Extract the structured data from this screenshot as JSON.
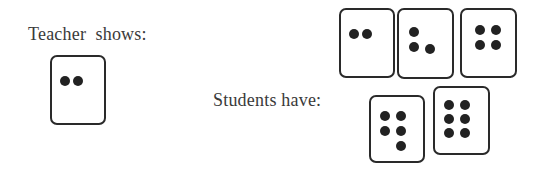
{
  "teacher": {
    "label": "Teacher  shows:",
    "card": {
      "count": 2,
      "dots": [
        [
          13,
          24
        ],
        [
          26,
          24
        ]
      ]
    }
  },
  "students": {
    "label": "Students have:",
    "cards": [
      {
        "count": 2,
        "dots": [
          [
            13,
            24
          ],
          [
            26,
            24
          ]
        ]
      },
      {
        "count": 3,
        "dots": [
          [
            15,
            22
          ],
          [
            15,
            37
          ],
          [
            31,
            39
          ]
        ]
      },
      {
        "count": 4,
        "dots": [
          [
            18,
            20
          ],
          [
            34,
            20
          ],
          [
            18,
            35
          ],
          [
            34,
            35
          ]
        ]
      },
      {
        "count": 5,
        "dots": [
          [
            14,
            19
          ],
          [
            30,
            19
          ],
          [
            14,
            34
          ],
          [
            30,
            34
          ],
          [
            30,
            49
          ]
        ]
      },
      {
        "count": 6,
        "dots": [
          [
            14,
            17
          ],
          [
            30,
            17
          ],
          [
            14,
            31
          ],
          [
            30,
            31
          ],
          [
            14,
            45
          ],
          [
            30,
            45
          ]
        ]
      }
    ]
  },
  "colors": {
    "card_border": "#2a2a2a",
    "dot": "#222222",
    "text": "#3a3a3a"
  }
}
